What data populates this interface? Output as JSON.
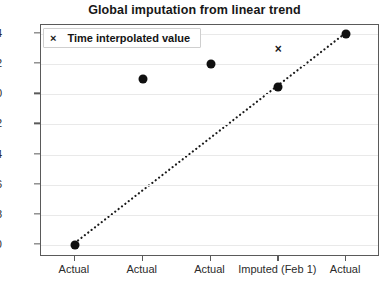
{
  "chart_data": {
    "type": "scatter",
    "title": "Global imputation from linear trend",
    "xlabel": "",
    "ylabel": "",
    "grid": true,
    "legend_position": "upper left",
    "categories": [
      "Actual",
      "Actual",
      "Actual",
      "Imputed (Feb 1)",
      "Actual"
    ],
    "x": [
      1,
      2,
      3,
      4,
      5
    ],
    "ylim": [
      -10.8,
      4.6
    ],
    "yticks": [
      4,
      2,
      0,
      -2,
      -4,
      -6,
      -8,
      -10
    ],
    "ytick_labels": [
      "4",
      "2",
      "0",
      "−2",
      "−4",
      "−6",
      "−8",
      "−10"
    ],
    "series": [
      {
        "name": "Observed / imputed value",
        "marker": "filled-circle",
        "color": "#101010",
        "values": [
          -10,
          1,
          2,
          0.5,
          4
        ]
      },
      {
        "name": "Time interpolated value",
        "marker": "x",
        "color": "#1a1a1a",
        "x": [
          4
        ],
        "values": [
          3
        ]
      },
      {
        "name": "Linear trend",
        "marker": "dotted-line",
        "color": "#1a1a1a",
        "x": [
          1,
          5
        ],
        "values": [
          -10,
          4
        ]
      }
    ]
  },
  "legend": {
    "marker": "×",
    "label": "Time interpolated value"
  },
  "axes": {
    "ytick_labels": [
      "4",
      "2",
      "0",
      "−2",
      "−4",
      "−6",
      "−8",
      "−10"
    ],
    "xtick_labels": [
      "Actual",
      "Actual",
      "Actual",
      "Imputed (Feb 1)",
      "Actual"
    ]
  }
}
